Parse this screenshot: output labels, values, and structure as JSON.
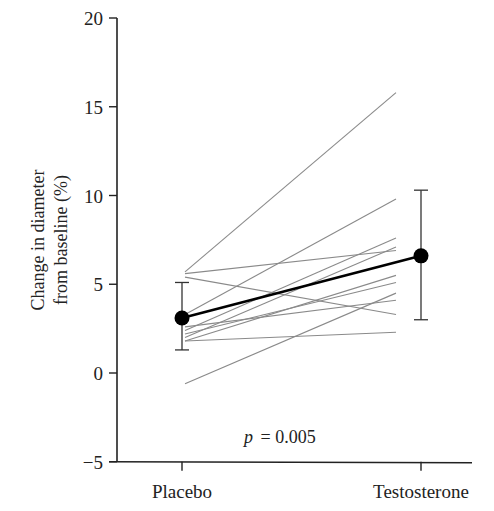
{
  "chart_data": {
    "type": "line",
    "title": "",
    "xlabel": "",
    "ylabel": "Change in diameter from baseline (%)",
    "ylabel_lines": [
      "Change in diameter",
      "from baseline (%)"
    ],
    "categories": [
      "Placebo",
      "Testosterone"
    ],
    "ylim": [
      -5,
      20
    ],
    "yticks": [
      -5,
      0,
      5,
      10,
      15,
      20
    ],
    "ytick_labels": [
      "−5",
      "0",
      "5",
      "10",
      "15",
      "20"
    ],
    "grid": false,
    "legend": null,
    "individual_series": [
      {
        "name": "subject-1",
        "values": [
          5.7,
          15.8
        ]
      },
      {
        "name": "subject-2",
        "values": [
          5.4,
          3.3
        ]
      },
      {
        "name": "subject-3",
        "values": [
          5.6,
          6.9
        ]
      },
      {
        "name": "subject-4",
        "values": [
          3.3,
          9.8
        ]
      },
      {
        "name": "subject-5",
        "values": [
          2.4,
          7.6
        ]
      },
      {
        "name": "subject-6",
        "values": [
          2.6,
          4.1
        ]
      },
      {
        "name": "subject-7",
        "values": [
          2.0,
          7.1
        ]
      },
      {
        "name": "subject-8",
        "values": [
          1.8,
          5.5
        ]
      },
      {
        "name": "subject-9",
        "values": [
          2.2,
          5.1
        ]
      },
      {
        "name": "subject-10",
        "values": [
          1.8,
          2.3
        ]
      },
      {
        "name": "subject-11",
        "values": [
          -0.6,
          4.5
        ]
      }
    ],
    "mean_series": {
      "name": "mean",
      "values": [
        3.1,
        6.6
      ],
      "error_low": [
        1.3,
        3.0
      ],
      "error_high": [
        5.1,
        10.3
      ]
    },
    "annotations": [
      {
        "text_italic": "p",
        "text": " = 0.005"
      }
    ]
  },
  "axis": {
    "ylabel_line1": "Change in diameter",
    "ylabel_line2": "from baseline (%)",
    "x_categories": [
      "Placebo",
      "Testosterone"
    ]
  },
  "annotation": {
    "p_symbol": "p",
    "p_value_text": "= 0.005"
  },
  "colors": {
    "individual_lines": "#8a8a8a",
    "mean_line": "#000000",
    "axis": "#222222"
  }
}
